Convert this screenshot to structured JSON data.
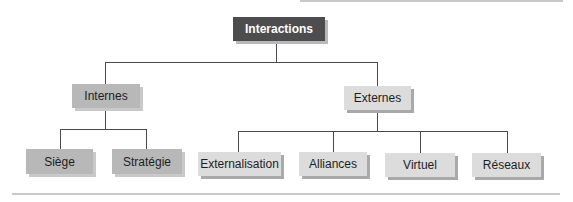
{
  "diagram": {
    "type": "org-chart",
    "root": {
      "label": "Interactions",
      "color": "#4d4d4f"
    },
    "level1": [
      {
        "label": "Internes",
        "color": "#b8b8b8"
      },
      {
        "label": "Externes",
        "color": "#dcdcdc"
      }
    ],
    "level2": [
      {
        "label": "Siège",
        "parent": "Internes"
      },
      {
        "label": "Stratégie",
        "parent": "Internes"
      },
      {
        "label": "Externalisation",
        "parent": "Externes"
      },
      {
        "label": "Alliances",
        "parent": "Externes"
      },
      {
        "label": "Virtuel",
        "parent": "Externes"
      },
      {
        "label": "Réseaux",
        "parent": "Externes"
      }
    ]
  }
}
